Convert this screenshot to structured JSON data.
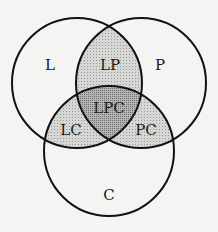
{
  "diagram": {
    "type": "venn",
    "sets": [
      {
        "id": "L",
        "label": "L",
        "cx": 77,
        "cy": 83,
        "r": 65
      },
      {
        "id": "P",
        "label": "P",
        "cx": 141,
        "cy": 83,
        "r": 65
      },
      {
        "id": "C",
        "label": "C",
        "cx": 109,
        "cy": 151,
        "r": 65
      }
    ],
    "regions": {
      "L": {
        "label": "L",
        "x": 50,
        "y": 66
      },
      "P": {
        "label": "P",
        "x": 160,
        "y": 66
      },
      "C": {
        "label": "C",
        "x": 109,
        "y": 196
      },
      "LP": {
        "label": "LP",
        "x": 109,
        "y": 66
      },
      "LC": {
        "label": "LC",
        "x": 71,
        "y": 131
      },
      "PC": {
        "label": "PC",
        "x": 146,
        "y": 131
      },
      "LPC": {
        "label": "LPC",
        "x": 109,
        "y": 109
      }
    },
    "colors": {
      "background": "#f4f4f2",
      "outline": "#111111",
      "pair_fill": "#d4d4d2",
      "triple_fill": "#a6a6a4"
    }
  }
}
